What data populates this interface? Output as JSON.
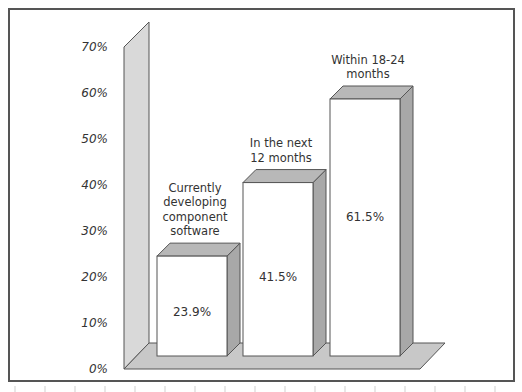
{
  "chart_data": {
    "type": "bar",
    "style": "3d",
    "title": "",
    "xlabel": "",
    "ylabel": "",
    "categories": [
      "Currently developing component software",
      "In the next 12 months",
      "Within 18-24 months"
    ],
    "category_label_lines": [
      [
        "Currently",
        "developing",
        "component",
        "software"
      ],
      [
        "In the next",
        "12 months"
      ],
      [
        "Within 18-24",
        "months"
      ]
    ],
    "values": [
      23.9,
      41.5,
      61.5
    ],
    "value_labels": [
      "23.9%",
      "41.5%",
      "61.5%"
    ],
    "ylim": [
      0,
      70
    ],
    "yticks": [
      0,
      10,
      20,
      30,
      40,
      50,
      60,
      70
    ],
    "ytick_labels": [
      "0%",
      "10%",
      "20%",
      "30%",
      "40%",
      "50%",
      "60%",
      "70%"
    ],
    "grid": false,
    "legend": null
  },
  "colors": {
    "frame": "#555555",
    "wall": "#d9d9d9",
    "floor": "#c8c8c8",
    "bar_front": "#ffffff",
    "bar_top": "#b8b8b8",
    "bar_side": "#a8a8a8",
    "outline": "#555555"
  }
}
